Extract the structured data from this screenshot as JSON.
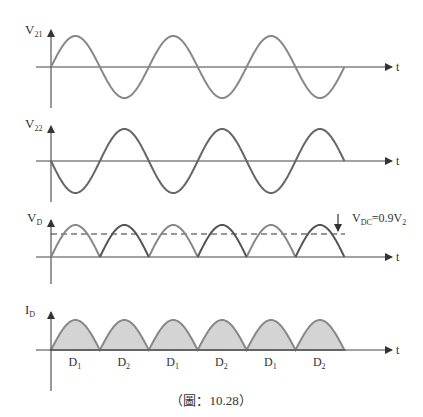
{
  "figure": {
    "caption": "（圖：10.28）",
    "colors": {
      "axis": "#444444",
      "wave": "#808080",
      "fill": "#d4d4d4",
      "text": "#333333"
    }
  },
  "panels": [
    {
      "id": "v21",
      "ylabel_main": "V",
      "ylabel_sub": "21",
      "xlabel": "t",
      "waveform": "sine",
      "phase": "positive-first"
    },
    {
      "id": "v22",
      "ylabel_main": "V",
      "ylabel_sub": "22",
      "xlabel": "t",
      "waveform": "sine",
      "phase": "negative-first"
    },
    {
      "id": "vd",
      "ylabel_main": "V",
      "ylabel_sub": "D",
      "xlabel": "t",
      "waveform": "rectified",
      "annotation": {
        "main": "V",
        "sub": "DC",
        "rest": "=0.9V",
        "rest_sub": "2"
      }
    },
    {
      "id": "id",
      "ylabel_main": "I",
      "ylabel_sub": "D",
      "xlabel": "t",
      "waveform": "rectified-filled",
      "segments": [
        {
          "main": "D",
          "sub": "1"
        },
        {
          "main": "D",
          "sub": "2"
        },
        {
          "main": "D",
          "sub": "1"
        },
        {
          "main": "D",
          "sub": "2"
        },
        {
          "main": "D",
          "sub": "1"
        },
        {
          "main": "D",
          "sub": "2"
        }
      ]
    }
  ]
}
